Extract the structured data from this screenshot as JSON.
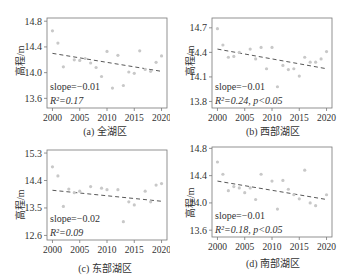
{
  "figure": {
    "panels": [
      {
        "id": "a",
        "caption": "(a) 全湖区",
        "ylabel": "高程/m",
        "slope_text": "slope=−0.01",
        "r2_text": "R²=0.17"
      },
      {
        "id": "b",
        "caption": "(b) 西部湖区",
        "ylabel": "高程/m",
        "slope_text": "slope=−0.01",
        "r2_text": "R²=0.24, p<0.05"
      },
      {
        "id": "c",
        "caption": "(c) 东部湖区",
        "ylabel": "高程/m",
        "slope_text": "slope=−0.02",
        "r2_text": "R²=0.09"
      },
      {
        "id": "d",
        "caption": "(d) 南部湖区",
        "ylabel": "高程/m",
        "slope_text": "slope=−0.01",
        "r2_text": "R²=0.18, p<0.05"
      }
    ]
  },
  "chart_data": [
    {
      "type": "scatter",
      "title": "(a) 全湖区",
      "xlabel": "",
      "ylabel": "高程/m",
      "xlim": [
        1999,
        2021
      ],
      "ylim": [
        13.45,
        14.85
      ],
      "xticks": [
        2000,
        2005,
        2010,
        2015,
        2020
      ],
      "yticks": [
        13.6,
        14.0,
        14.4,
        14.8
      ],
      "x": [
        2000,
        2001,
        2002,
        2004,
        2005,
        2006,
        2007,
        2008,
        2009,
        2010,
        2011,
        2012,
        2013,
        2014,
        2015,
        2016,
        2017,
        2018,
        2019,
        2020
      ],
      "y": [
        14.65,
        14.46,
        14.09,
        14.2,
        14.19,
        14.22,
        14.15,
        14.08,
        13.94,
        14.33,
        13.76,
        14.27,
        13.8,
        14.01,
        13.99,
        14.34,
        14.05,
        14.02,
        14.16,
        14.26
      ],
      "trend": {
        "x": [
          2000,
          2020
        ],
        "y": [
          14.3,
          14.02
        ],
        "style": "dashed"
      },
      "annotations": [
        "slope=−0.01",
        "R²=0.17"
      ]
    },
    {
      "type": "scatter",
      "title": "(b) 西部湖区",
      "xlabel": "",
      "ylabel": "高程/m",
      "xlim": [
        1999,
        2021
      ],
      "ylim": [
        13.72,
        14.82
      ],
      "xticks": [
        2000,
        2005,
        2010,
        2015,
        2020
      ],
      "yticks": [
        13.8,
        14.1,
        14.4,
        14.7
      ],
      "x": [
        2000,
        2001,
        2002,
        2003,
        2004,
        2006,
        2007,
        2008,
        2009,
        2010,
        2011,
        2012,
        2013,
        2014,
        2015,
        2016,
        2017,
        2018,
        2019,
        2020
      ],
      "y": [
        14.69,
        14.49,
        14.34,
        14.35,
        14.4,
        14.44,
        14.32,
        14.46,
        14.2,
        14.46,
        13.98,
        14.24,
        14.19,
        14.2,
        14.11,
        14.34,
        14.28,
        14.28,
        14.32,
        14.41
      ],
      "trend": {
        "x": [
          2000,
          2020
        ],
        "y": [
          14.44,
          14.2
        ],
        "style": "dashed"
      },
      "annotations": [
        "slope=−0.01",
        "R²=0.24, p<0.05"
      ]
    },
    {
      "type": "scatter",
      "title": "(c) 东部湖区",
      "xlabel": "",
      "ylabel": "高程/m",
      "xlim": [
        1999,
        2021
      ],
      "ylim": [
        12.45,
        15.4
      ],
      "xticks": [
        2000,
        2005,
        2010,
        2015,
        2020
      ],
      "yticks": [
        12.6,
        13.5,
        14.4,
        15.3
      ],
      "x": [
        2000,
        2001,
        2002,
        2003,
        2004,
        2005,
        2007,
        2009,
        2010,
        2012,
        2013,
        2014,
        2015,
        2017,
        2018,
        2019,
        2020
      ],
      "y": [
        14.85,
        14.55,
        13.55,
        14.12,
        14.0,
        14.05,
        14.2,
        14.15,
        14.1,
        14.1,
        13.05,
        13.7,
        13.6,
        14.05,
        13.7,
        14.25,
        14.3
      ],
      "trend": {
        "x": [
          2000,
          2020
        ],
        "y": [
          14.08,
          13.72
        ],
        "style": "dashed"
      },
      "annotations": [
        "slope=−0.02",
        "R²=0.09"
      ]
    },
    {
      "type": "scatter",
      "title": "(d) 南部湖区",
      "xlabel": "",
      "ylabel": "高程/m",
      "xlim": [
        1999,
        2021
      ],
      "ylim": [
        13.5,
        14.82
      ],
      "xticks": [
        2000,
        2005,
        2010,
        2015,
        2020
      ],
      "yticks": [
        13.6,
        14.0,
        14.4,
        14.8
      ],
      "x": [
        2000,
        2001,
        2002,
        2003,
        2004,
        2005,
        2006,
        2007,
        2008,
        2010,
        2011,
        2012,
        2013,
        2014,
        2015,
        2016,
        2017,
        2018,
        2020
      ],
      "y": [
        14.6,
        14.42,
        14.18,
        14.24,
        14.22,
        14.15,
        14.22,
        14.05,
        14.42,
        14.32,
        13.91,
        14.33,
        14.2,
        14.12,
        14.06,
        14.48,
        14.0,
        13.96,
        14.12
      ],
      "trend": {
        "x": [
          2000,
          2020
        ],
        "y": [
          14.32,
          14.05
        ],
        "style": "dashed"
      },
      "annotations": [
        "slope=−0.01",
        "R²=0.18, p<0.05"
      ]
    }
  ]
}
